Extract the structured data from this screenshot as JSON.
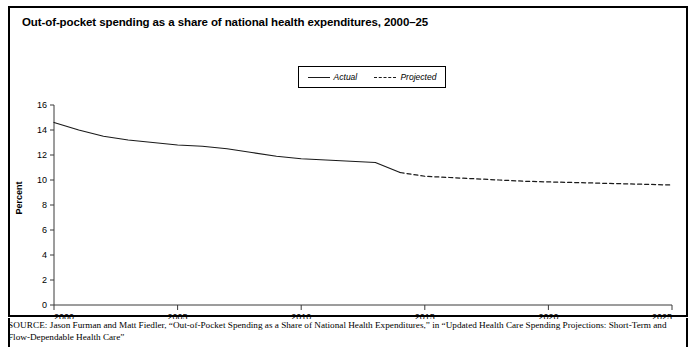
{
  "figure": {
    "title": "Out-of-pocket spending as a share of national health expenditures, 2000–25"
  },
  "legend": {
    "actual_label": "Actual",
    "projected_label": "Projected"
  },
  "source": {
    "kicker": "SOURCE:",
    "text": " Jason Furman and Matt Fiedler, “Out-of-Pocket Spending as a Share of National Health Expenditures,” in “Updated Health Care Spending Projections: Short-Term and Flow-Dependable Health Care”"
  },
  "chart_data": {
    "type": "line",
    "title": "Out-of-pocket spending as a share of national health expenditures, 2000–25",
    "xlabel": "",
    "ylabel": "Percent",
    "xlim": [
      2000,
      2025
    ],
    "ylim": [
      0,
      16
    ],
    "ytick_labels": [
      "0",
      "2",
      "4",
      "6",
      "8",
      "10",
      "12",
      "14",
      "16"
    ],
    "yticks": [
      0,
      2,
      4,
      6,
      8,
      10,
      12,
      14,
      16
    ],
    "xtick_labels": [
      "2000",
      "2005",
      "2010",
      "2015",
      "2020",
      "2025"
    ],
    "xticks": [
      2000,
      2005,
      2010,
      2015,
      2020,
      2025
    ],
    "grid": false,
    "legend_position": "top-center",
    "series": [
      {
        "name": "Actual",
        "style": "solid",
        "color": "#1a1a1a",
        "x": [
          2000,
          2001,
          2002,
          2003,
          2004,
          2005,
          2006,
          2007,
          2008,
          2009,
          2010,
          2011,
          2012,
          2013,
          2014
        ],
        "values": [
          14.6,
          14.0,
          13.5,
          13.2,
          13.0,
          12.8,
          12.7,
          12.5,
          12.2,
          11.9,
          11.7,
          11.6,
          11.5,
          11.4,
          10.6
        ]
      },
      {
        "name": "Projected",
        "style": "dashed",
        "color": "#1a1a1a",
        "x": [
          2014,
          2015,
          2016,
          2017,
          2018,
          2019,
          2020,
          2021,
          2022,
          2023,
          2024,
          2025
        ],
        "values": [
          10.6,
          10.3,
          10.2,
          10.1,
          10.0,
          9.9,
          9.85,
          9.8,
          9.75,
          9.7,
          9.65,
          9.6
        ]
      }
    ]
  }
}
